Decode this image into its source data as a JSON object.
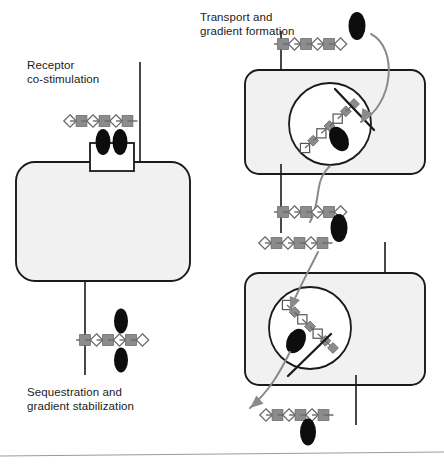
{
  "figure": {
    "width": 444,
    "height": 466,
    "background": "#ffffff",
    "bottom_rule_color": "#9a9a9a"
  },
  "labels": {
    "receptor": "Receptor\nco-stimulation",
    "sequestration": "Sequestration and\ngradient stabilization",
    "transport": "Transport and\ngradient formation"
  },
  "colors": {
    "cell_fill": "#f1f1f1",
    "cell_stroke": "#1a1a1a",
    "vesicle_fill": "#ffffff",
    "vesicle_stroke": "#1a1a1a",
    "square_gray": "#8c8c8c",
    "diamond_white": "#ffffff",
    "glyph_stroke": "#6b6b6b",
    "oval_black": "#0d0d0d",
    "arrow_gray": "#8a8a8a",
    "line_dark": "#1a1a1a",
    "receptor_fill": "#ffffff",
    "text": "#1b1b1b"
  },
  "glyph_legend": {
    "square": "gray-square-glycan-unit",
    "diamond": "white-diamond-glycan-unit",
    "oval": "black-oval-ligand",
    "open_square": "white-square-glycan-unit",
    "gray_diamond": "gray-diamond-glycan-unit"
  },
  "panels": {
    "left": {
      "name": "receptor-co-stimulation-panel",
      "cell": {
        "x": 16,
        "y": 162,
        "w": 174,
        "h": 119,
        "rx": 19
      },
      "receptor_box": {
        "x": 90,
        "y": 143,
        "w": 44,
        "h": 28
      },
      "receptor_ovals": [
        {
          "cx": 103,
          "cy": 142,
          "rx": 7.5,
          "ry": 13
        },
        {
          "cx": 120,
          "cy": 142,
          "rx": 7.5,
          "ry": 13
        }
      ],
      "membrane_stub_top": {
        "x": 140,
        "y1": 62,
        "y2": 172
      },
      "membrane_stub_bottom": {
        "x": 85,
        "y1": 281,
        "y2": 375
      },
      "chain_top": {
        "x": 70,
        "y": 121,
        "step": 11.5,
        "units": [
          "diamond",
          "square",
          "diamond",
          "square",
          "diamond",
          "square"
        ],
        "tail": "right-tick"
      },
      "chain_bottom": {
        "x": 85,
        "y": 340,
        "step": 11.5,
        "units": [
          "square",
          "diamond",
          "square",
          "diamond",
          "square",
          "diamond"
        ],
        "tail": "left-tick"
      },
      "bottom_ovals": [
        {
          "cx": 121,
          "cy": 321,
          "rx": 7,
          "ry": 12.5
        },
        {
          "cx": 121,
          "cy": 360,
          "rx": 7,
          "ry": 12.5
        }
      ]
    },
    "upper_right": {
      "name": "transport-and-gradient-formation-panel",
      "cell": {
        "x": 245,
        "y": 70,
        "w": 180,
        "h": 104,
        "rx": 14
      },
      "vesicle": {
        "cx": 330,
        "cy": 124,
        "r": 41
      },
      "membrane_stub_top": {
        "x": 281,
        "y1": 31,
        "y2": 80
      },
      "membrane_stub_bottom": {
        "x": 281,
        "y1": 164,
        "y2": 233
      },
      "chain_top": {
        "x": 283,
        "y": 44,
        "step": 11.5,
        "units": [
          "square",
          "diamond",
          "square",
          "diamond",
          "square",
          "diamond"
        ],
        "tail": "left-tick"
      },
      "chain_below": {
        "x": 283,
        "y": 212,
        "step": 11.5,
        "units": [
          "square",
          "diamond",
          "square",
          "diamond",
          "square",
          "diamond"
        ],
        "tail": "left-tick"
      },
      "vesicle_chain": {
        "x1": 305,
        "y1": 148,
        "x2": 354,
        "y2": 104,
        "count": 7,
        "units": [
          "open_square",
          "gray_diamond",
          "open_square",
          "gray_diamond",
          "open_square",
          "gray_diamond",
          "gray_diamond"
        ]
      },
      "vesicle_oval": {
        "cx": 339,
        "cy": 139,
        "rx": 9,
        "ry": 13,
        "rot": -28
      },
      "vesicle_slash": {
        "x1": 335,
        "y1": 89,
        "x2": 374,
        "y2": 130
      },
      "entering_oval": {
        "cx": 357,
        "cy": 26,
        "rx": 8.5,
        "ry": 14
      },
      "arrow_in": {
        "d": "M 371 34 C 398 48 394 104 361 122",
        "head": [
          361,
          122
        ]
      },
      "arrow_out": {
        "d": "M 330 166 C 313 182 322 200 310 222"
      }
    },
    "lower_right": {
      "name": "sequestration-lower-panel",
      "cell": {
        "x": 245,
        "y": 273,
        "w": 180,
        "h": 112,
        "rx": 14
      },
      "vesicle": {
        "cx": 310,
        "cy": 328,
        "r": 41
      },
      "membrane_stub_top": {
        "x": 385,
        "y1": 242,
        "y2": 284
      },
      "membrane_stub_bottom": {
        "x": 356,
        "y1": 375,
        "y2": 425
      },
      "chain_between": {
        "x": 265,
        "y": 243,
        "step": 11.5,
        "units": [
          "diamond",
          "square",
          "diamond",
          "square",
          "diamond",
          "square"
        ],
        "tail": "right-tick"
      },
      "middle_oval": {
        "cx": 339,
        "cy": 228,
        "rx": 8.5,
        "ry": 14
      },
      "vesicle_chain": {
        "x1": 287,
        "y1": 305,
        "x2": 333,
        "y2": 348,
        "count": 7,
        "units": [
          "open_square",
          "gray_diamond",
          "open_square",
          "gray_diamond",
          "open_square",
          "gray_diamond",
          "gray_diamond"
        ]
      },
      "vesicle_oval": {
        "cx": 296,
        "cy": 341,
        "rx": 9,
        "ry": 13,
        "rot": 28
      },
      "vesicle_slash": {
        "x1": 288,
        "y1": 376,
        "x2": 331,
        "y2": 334
      },
      "chain_bottom": {
        "x": 266,
        "y": 415,
        "step": 11.5,
        "units": [
          "diamond",
          "square",
          "diamond",
          "square",
          "diamond",
          "square"
        ],
        "tail": "right-tick"
      },
      "bottom_oval": {
        "cx": 308,
        "cy": 432,
        "rx": 8,
        "ry": 13.5
      },
      "arrow_in": {
        "d": "M 318 252 C 306 276 297 292 290 310",
        "head": [
          290,
          310
        ]
      },
      "arrow_out": {
        "d": "M 290 352 C 278 376 268 392 250 408",
        "head": [
          250,
          408
        ]
      }
    }
  }
}
